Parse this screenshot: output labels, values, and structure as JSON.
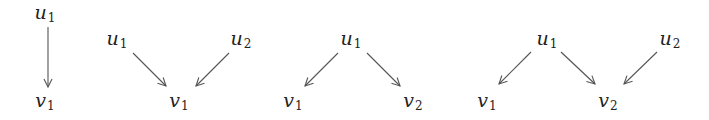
{
  "diagrams": [
    {
      "id": "d1",
      "nodes": [
        {
          "id": "d1-u1",
          "base": "u",
          "sub": "1",
          "x": 45,
          "y": 13
        },
        {
          "id": "d1-v1",
          "base": "v",
          "sub": "1",
          "x": 45,
          "y": 101
        }
      ],
      "edges": [
        {
          "from": "d1-u1",
          "to": "d1-v1",
          "x1": 48,
          "y1": 27,
          "x2": 48,
          "y2": 87
        }
      ]
    },
    {
      "id": "d2",
      "nodes": [
        {
          "id": "d2-u1",
          "base": "u",
          "sub": "1",
          "x": 117,
          "y": 39
        },
        {
          "id": "d2-u2",
          "base": "u",
          "sub": "2",
          "x": 241,
          "y": 39
        },
        {
          "id": "d2-v1",
          "base": "v",
          "sub": "1",
          "x": 179,
          "y": 101
        }
      ],
      "edges": [
        {
          "from": "d2-u1",
          "to": "d2-v1",
          "x1": 133,
          "y1": 53,
          "x2": 166,
          "y2": 86
        },
        {
          "from": "d2-u2",
          "to": "d2-v1",
          "x1": 229,
          "y1": 53,
          "x2": 196,
          "y2": 86
        }
      ]
    },
    {
      "id": "d3",
      "nodes": [
        {
          "id": "d3-u1",
          "base": "u",
          "sub": "1",
          "x": 351,
          "y": 39
        },
        {
          "id": "d3-v1",
          "base": "v",
          "sub": "1",
          "x": 293,
          "y": 101
        },
        {
          "id": "d3-v2",
          "base": "v",
          "sub": "2",
          "x": 413,
          "y": 101
        }
      ],
      "edges": [
        {
          "from": "d3-u1",
          "to": "d3-v1",
          "x1": 338,
          "y1": 53,
          "x2": 305,
          "y2": 86
        },
        {
          "from": "d3-u1",
          "to": "d3-v2",
          "x1": 367,
          "y1": 53,
          "x2": 400,
          "y2": 86
        }
      ]
    },
    {
      "id": "d4",
      "nodes": [
        {
          "id": "d4-u1",
          "base": "u",
          "sub": "1",
          "x": 547,
          "y": 39
        },
        {
          "id": "d4-u2",
          "base": "u",
          "sub": "2",
          "x": 670,
          "y": 39
        },
        {
          "id": "d4-v1",
          "base": "v",
          "sub": "1",
          "x": 487,
          "y": 101
        },
        {
          "id": "d4-v2",
          "base": "v",
          "sub": "2",
          "x": 608,
          "y": 101
        }
      ],
      "edges": [
        {
          "from": "d4-u1",
          "to": "d4-v1",
          "x1": 531,
          "y1": 52,
          "x2": 499,
          "y2": 84
        },
        {
          "from": "d4-u1",
          "to": "d4-v2",
          "x1": 561,
          "y1": 52,
          "x2": 595,
          "y2": 84
        },
        {
          "from": "d4-u2",
          "to": "d4-v2",
          "x1": 657,
          "y1": 52,
          "x2": 624,
          "y2": 84
        }
      ]
    }
  ],
  "style": {
    "edge_color": "#555555",
    "text_color": "#222222"
  }
}
